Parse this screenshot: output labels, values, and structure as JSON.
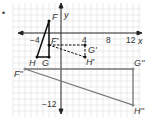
{
  "bullet": "•",
  "axes": {
    "x_label": "x",
    "y_label": "y",
    "ticks": {
      "neg4": "−4",
      "4": "4",
      "8": "8",
      "12": "12",
      "neg12": "−12"
    }
  },
  "points": {
    "F": {
      "label": "F",
      "x": -2,
      "y": 2
    },
    "G": {
      "label": "G",
      "x": -2,
      "y": -4
    },
    "H": {
      "label": "H",
      "x": -4,
      "y": -4
    },
    "F1": {
      "label": "F'",
      "x": -2,
      "y": -2
    },
    "G1": {
      "label": "G'",
      "x": 4,
      "y": -2
    },
    "H1": {
      "label": "H'",
      "x": 4,
      "y": -4
    },
    "F2": {
      "label": "F''",
      "x": -6,
      "y": -6
    },
    "G2": {
      "label": "G''",
      "x": 12,
      "y": -6
    },
    "H2": {
      "label": "H''",
      "x": 12,
      "y": -12
    }
  },
  "colors": {
    "original": "#111111",
    "image1": "#111111",
    "image2": "#777777",
    "grid": "#dddddd"
  }
}
